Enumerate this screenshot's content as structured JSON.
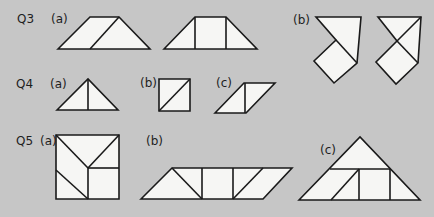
{
  "questions": [
    {
      "id": "q3",
      "label": "Q3",
      "parts": [
        {
          "id": "a",
          "label": "(a)",
          "description": "Trapezoid split into a parallelogram and a triangle; trapezoid split into triangle, square, triangle"
        },
        {
          "id": "b",
          "label": "(b)",
          "description": "Pentagon-like shapes composed of square and triangles"
        }
      ]
    },
    {
      "id": "q4",
      "label": "Q4",
      "parts": [
        {
          "id": "a",
          "label": "(a)",
          "description": "Triangle split by vertical line"
        },
        {
          "id": "b",
          "label": "(b)",
          "description": "Square split by diagonal"
        },
        {
          "id": "c",
          "label": "(c)",
          "description": "Parallelogram split by vertical line"
        }
      ]
    },
    {
      "id": "q5",
      "label": "Q5",
      "parts": [
        {
          "id": "a",
          "label": "(a)",
          "description": "Square composed of triangles and a small square"
        },
        {
          "id": "b",
          "label": "(b)",
          "description": "Parallelogram composed of triangles, square and parallelogram"
        },
        {
          "id": "c",
          "label": "(c)",
          "description": "Large triangle composed of triangles, parallelogram and square"
        }
      ]
    }
  ],
  "colors": {
    "background": "#c6c6c6",
    "shape_fill": "#f6f6f4",
    "stroke": "#1a1a1a"
  }
}
